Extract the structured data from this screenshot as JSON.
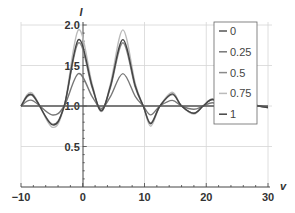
{
  "chart_data": {
    "type": "line",
    "title": "",
    "xlabel": "v",
    "ylabel": "I",
    "xlim": [
      -10,
      30
    ],
    "ylim": [
      0,
      2.0
    ],
    "x_ticks": [
      -10,
      0,
      10,
      20,
      30
    ],
    "x_tick_labels": [
      "−10",
      "0",
      "10",
      "20",
      "30"
    ],
    "y_ticks": [
      0.5,
      1.0,
      1.5,
      2.0
    ],
    "y_tick_labels": [
      "0.5",
      "1.0",
      "1.5",
      "2.0"
    ],
    "grid": true,
    "legend_position": "upper right, inside plot",
    "x": [
      -10,
      -8.2,
      -5,
      -3,
      -0.7,
      1.5,
      3,
      4.5,
      6.5,
      8.5,
      9.8,
      11,
      12.5,
      14.5,
      16,
      18,
      19.5,
      21,
      23,
      25,
      27,
      28.5,
      30
    ],
    "series": [
      {
        "name": "0",
        "color": "#555555",
        "values": [
          1.0,
          1.0,
          1.0,
          1.0,
          1.0,
          1.0,
          1.0,
          1.0,
          1.0,
          1.0,
          1.0,
          1.0,
          1.0,
          1.0,
          1.0,
          1.0,
          1.0,
          1.0,
          1.0,
          1.0,
          1.0,
          1.0,
          1.0
        ]
      },
      {
        "name": "0.25",
        "color": "#777777",
        "values": [
          1.0,
          1.07,
          0.89,
          1.0,
          1.4,
          1.12,
          0.97,
          1.12,
          1.4,
          1.12,
          1.0,
          0.89,
          1.0,
          1.07,
          1.0,
          0.96,
          1.0,
          1.04,
          1.0,
          0.98,
          1.02,
          1.0,
          0.99
        ]
      },
      {
        "name": "0.5",
        "color": "#8a8a8a",
        "values": [
          1.0,
          1.13,
          0.78,
          1.0,
          1.78,
          1.23,
          0.95,
          1.23,
          1.78,
          1.23,
          1.0,
          0.79,
          1.0,
          1.14,
          1.0,
          0.91,
          1.0,
          1.08,
          1.0,
          0.96,
          1.03,
          1.0,
          0.98
        ]
      },
      {
        "name": "0.75",
        "color": "#bbbbbb",
        "values": [
          1.0,
          1.16,
          0.74,
          1.0,
          1.94,
          1.28,
          0.93,
          1.28,
          1.94,
          1.28,
          1.0,
          0.75,
          1.0,
          1.17,
          1.0,
          0.9,
          1.0,
          1.09,
          1.0,
          0.95,
          1.04,
          1.0,
          0.98
        ]
      },
      {
        "name": "1",
        "color": "#444444",
        "values": [
          1.0,
          1.14,
          0.77,
          1.0,
          1.82,
          1.25,
          0.94,
          1.25,
          1.82,
          1.25,
          1.0,
          0.78,
          1.0,
          1.15,
          1.0,
          0.91,
          1.0,
          1.08,
          1.0,
          0.96,
          1.03,
          1.0,
          0.98
        ]
      }
    ]
  }
}
